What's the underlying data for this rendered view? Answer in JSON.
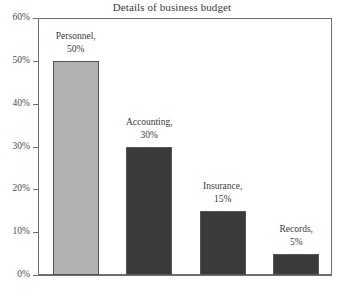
{
  "chart_data": {
    "type": "bar",
    "title": "Details of business budget",
    "xlabel": "",
    "ylabel": "",
    "ylim": [
      0,
      60
    ],
    "grid": false,
    "legend": "none",
    "y_tick_labels": [
      "60%",
      "50%",
      "40%",
      "30%",
      "20%",
      "10%",
      "0%"
    ],
    "y_tick_values": [
      60,
      50,
      40,
      30,
      20,
      10,
      0
    ],
    "categories": [
      "Personnel",
      "Accounting",
      "Insurance",
      "Records"
    ],
    "values": [
      50,
      30,
      15,
      5
    ],
    "value_labels": [
      "50%",
      "30%",
      "15%",
      "5%"
    ],
    "point_labels": [
      {
        "name": "Personnel,",
        "value": "50%"
      },
      {
        "name": "Accounting,",
        "value": "30%"
      },
      {
        "name": "Insurance,",
        "value": "15%"
      },
      {
        "name": "Records,",
        "value": "5%"
      }
    ],
    "colors": [
      "#b2b2b2",
      "#3a3a3a",
      "#3a3a3a",
      "#3a3a3a"
    ],
    "axis_color": "#6f6f6f",
    "text_color": "#3a3a3a",
    "background": "#ffffff"
  }
}
